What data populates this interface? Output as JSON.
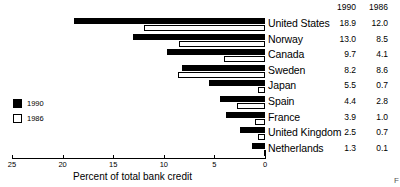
{
  "chart_data": {
    "type": "bar",
    "orientation": "horizontal",
    "title": "",
    "xlabel": "Percent of total bank credit",
    "ylabel": "",
    "xlim": [
      25,
      0
    ],
    "x_axis_reversed": true,
    "xticks": [
      25,
      20,
      15,
      10,
      5,
      0
    ],
    "xtick_labels": [
      "25",
      "20",
      "15",
      "10",
      "5",
      "0"
    ],
    "grid": false,
    "legend_position": "left-middle",
    "categories": [
      "United States",
      "Norway",
      "Canada",
      "Sweden",
      "Japan",
      "Spain",
      "France",
      "United Kingdom",
      "Netherlands"
    ],
    "series": [
      {
        "name": "1990",
        "style": "filled-black",
        "values": [
          18.9,
          13.0,
          9.7,
          8.2,
          5.5,
          4.4,
          3.9,
          2.5,
          1.3
        ]
      },
      {
        "name": "1986",
        "style": "hollow-white",
        "values": [
          12.0,
          8.5,
          4.1,
          8.6,
          0.7,
          2.8,
          1.0,
          0.7,
          0.1
        ]
      }
    ]
  },
  "table": {
    "column_headers": [
      "1990",
      "1986"
    ],
    "rows": [
      {
        "country": "United States",
        "v1990": "18.9",
        "v1986": "12.0"
      },
      {
        "country": "Norway",
        "v1990": "13.0",
        "v1986": "8.5"
      },
      {
        "country": "Canada",
        "v1990": "9.7",
        "v1986": "4.1"
      },
      {
        "country": "Sweden",
        "v1990": "8.2",
        "v1986": "8.6"
      },
      {
        "country": "Japan",
        "v1990": "5.5",
        "v1986": "0.7"
      },
      {
        "country": "Spain",
        "v1990": "4.4",
        "v1986": "2.8"
      },
      {
        "country": "France",
        "v1990": "3.9",
        "v1986": "1.0"
      },
      {
        "country": "United Kingdom",
        "v1990": "2.5",
        "v1986": "0.7"
      },
      {
        "country": "Netherlands",
        "v1990": "1.3",
        "v1986": "0.1"
      }
    ]
  },
  "legend": {
    "items": [
      {
        "label": "1990",
        "style": "filled"
      },
      {
        "label": "1986",
        "style": "hollow"
      }
    ]
  },
  "axis": {
    "title": "Percent of total bank credit",
    "tick_labels": [
      "25",
      "20",
      "15",
      "10",
      "5",
      "0"
    ]
  },
  "corner_mark": "F"
}
